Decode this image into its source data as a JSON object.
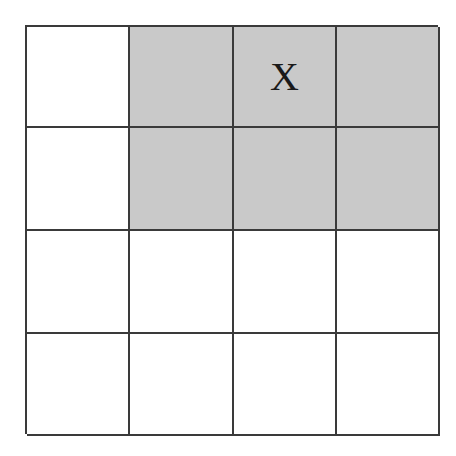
{
  "grid": {
    "rows": 4,
    "cols": 4,
    "shade_color": "#c9c9c9",
    "line_color": "#3a3a3a",
    "cells": [
      [
        {
          "label": "",
          "shaded": false
        },
        {
          "label": "",
          "shaded": true
        },
        {
          "label": "X",
          "shaded": true
        },
        {
          "label": "",
          "shaded": true
        }
      ],
      [
        {
          "label": "",
          "shaded": false
        },
        {
          "label": "",
          "shaded": true
        },
        {
          "label": "",
          "shaded": true
        },
        {
          "label": "",
          "shaded": true
        }
      ],
      [
        {
          "label": "",
          "shaded": false
        },
        {
          "label": "",
          "shaded": false
        },
        {
          "label": "",
          "shaded": false
        },
        {
          "label": "",
          "shaded": false
        }
      ],
      [
        {
          "label": "",
          "shaded": false
        },
        {
          "label": "",
          "shaded": false
        },
        {
          "label": "",
          "shaded": false
        },
        {
          "label": "",
          "shaded": false
        }
      ]
    ]
  }
}
